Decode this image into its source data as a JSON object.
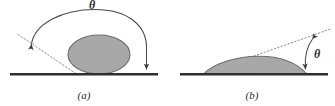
{
  "figure": {
    "background_color": "#ffffff",
    "line_color": "#3a3a3a",
    "baseline_color": "#2f2f2f",
    "droplet_fill": "#a8a8a8",
    "droplet_stroke": "#6e6e6e",
    "dotted_color": "#8a8a8a",
    "text_color": "#2b2b2b"
  },
  "panels": [
    {
      "id": "a",
      "caption": "(a)",
      "angle_symbol": "θ",
      "description": "non-wetting droplet with large contact angle",
      "baseline": {
        "x1": 10,
        "y1": 74,
        "x2": 158,
        "y2": 74
      },
      "droplet": {
        "cx": 99,
        "cy": 62,
        "rx": 31,
        "ry": 19
      },
      "tangent_dotted": {
        "x1": 20,
        "y1": 36,
        "x2": 76,
        "y2": 74
      },
      "arc_arrow_start": {
        "x": 30,
        "y": 43
      },
      "arc_arrow_end": {
        "x": 146,
        "y": 72
      },
      "theta_label_pos": {
        "x": 92,
        "y": 13
      }
    },
    {
      "id": "b",
      "caption": "(b)",
      "angle_symbol": "θ",
      "description": "wetting droplet with small contact angle",
      "baseline": {
        "x1": 180,
        "y1": 74,
        "x2": 328,
        "y2": 74
      },
      "droplet": {
        "left": 204,
        "right": 306,
        "apex_y": 60,
        "base_y": 74
      },
      "tangent_dotted": {
        "x1": 204,
        "y1": 74,
        "x2": 330,
        "y2": 30
      },
      "arc_arrow_start": {
        "x": 311,
        "y": 40
      },
      "arc_arrow_end": {
        "x": 306,
        "y": 72
      },
      "theta_label_pos": {
        "x": 316,
        "y": 55
      }
    }
  ]
}
